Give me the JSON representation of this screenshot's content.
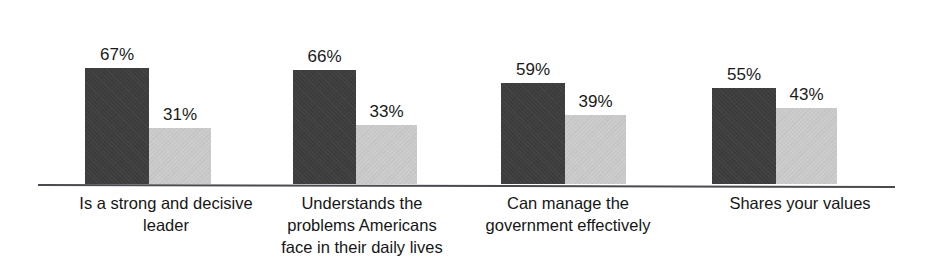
{
  "chart_data": {
    "type": "bar",
    "title": "",
    "subtitle": "",
    "xlabel": "",
    "ylabel": "",
    "ylim": [
      0,
      100
    ],
    "grid": false,
    "legend_position": "none",
    "value_suffix": "%",
    "categories": [
      "Is a strong and decisive leader",
      "Understands the problems Americans face in their daily lives",
      "Can manage the government effectively",
      "Shares your values"
    ],
    "category_lines": [
      [
        "Is a strong and decisive",
        "leader"
      ],
      [
        "Understands the",
        "problems Americans",
        "face in their daily lives"
      ],
      [
        "Can manage the",
        "government effectively"
      ],
      [
        "Shares your values"
      ]
    ],
    "series": [
      {
        "name": "Series 1",
        "color": "#3d3d3d",
        "values": [
          67,
          66,
          59,
          55
        ]
      },
      {
        "name": "Series 2",
        "color": "#cbcbcb",
        "values": [
          31,
          33,
          39,
          43
        ]
      }
    ],
    "value_labels": [
      [
        "67%",
        "31%"
      ],
      [
        "66%",
        "33%"
      ],
      [
        "59%",
        "39%"
      ],
      [
        "55%",
        "43%"
      ]
    ],
    "axis_color": "#4a4a52",
    "background_color": "#ffffff"
  },
  "groups": [
    {
      "key": "strong-decisive-leader",
      "left": 85,
      "label_left": 30,
      "label_width": 272,
      "bars": [
        {
          "key": "dark",
          "value": 67,
          "label": "67%",
          "x": 0,
          "width": 64,
          "height": 116
        },
        {
          "key": "light",
          "value": 31,
          "label": "31%",
          "x": 64,
          "width": 62,
          "height": 56
        }
      ]
    },
    {
      "key": "understands-problems",
      "left": 293,
      "label_left": 248,
      "label_width": 228,
      "bars": [
        {
          "key": "dark",
          "value": 66,
          "label": "66%",
          "x": 0,
          "width": 63,
          "height": 114
        },
        {
          "key": "light",
          "value": 33,
          "label": "33%",
          "x": 63,
          "width": 61,
          "height": 59
        }
      ]
    },
    {
      "key": "manage-government",
      "left": 501,
      "label_left": 455,
      "label_width": 226,
      "bars": [
        {
          "key": "dark",
          "value": 59,
          "label": "59%",
          "x": 0,
          "width": 64,
          "height": 101
        },
        {
          "key": "light",
          "value": 39,
          "label": "39%",
          "x": 64,
          "width": 61,
          "height": 69
        }
      ]
    },
    {
      "key": "shares-your-values",
      "left": 712,
      "label_left": 688,
      "label_width": 224,
      "bars": [
        {
          "key": "dark",
          "value": 55,
          "label": "55%",
          "x": 0,
          "width": 64,
          "height": 96
        },
        {
          "key": "light",
          "value": 43,
          "label": "43%",
          "x": 64,
          "width": 61,
          "height": 76
        }
      ]
    }
  ]
}
